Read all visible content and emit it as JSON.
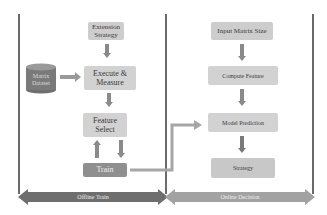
{
  "offline": {
    "extension_strategy": "Extension Strategy",
    "matrix_dataset": "Matrix Dataset",
    "execute_measure": "Execute & Measure",
    "feature_select": "Feature Select",
    "train": "Train",
    "band_label": "Offline Train"
  },
  "online": {
    "input_matrix_size": "Input Matrix Size",
    "compute_feature": "Compute Feature",
    "model_prediction": "Model Prediction",
    "strategy": "Strategy",
    "band_label": "Online Decision"
  },
  "colors": {
    "box_fill": "#cfcfcf",
    "dark_box": "#8f8f8f",
    "cylinder": "#7a7a7a",
    "arrow": "#8a8a8a",
    "band_offline": "#6e6e6e",
    "band_online": "#9a9a9a"
  }
}
